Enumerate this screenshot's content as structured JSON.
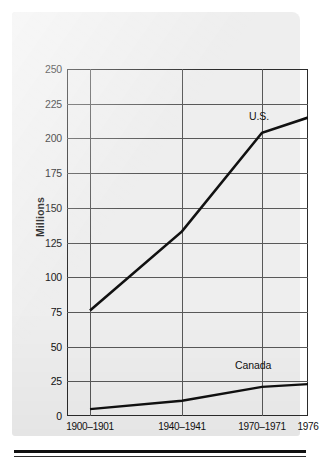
{
  "chart_data": {
    "type": "line",
    "title": "",
    "xlabel": "",
    "ylabel": "Millions",
    "ylim": [
      0,
      250
    ],
    "yticks": [
      0,
      25,
      50,
      75,
      100,
      125,
      150,
      175,
      200,
      225,
      250
    ],
    "ytick_labels": [
      "0",
      "25",
      "50",
      "75",
      "100",
      "125",
      "150",
      "175",
      "200",
      "225",
      "250"
    ],
    "categories": [
      "1900–1901",
      "1940–1941",
      "1970–1971",
      "1976"
    ],
    "grid": true,
    "legend_position": "inline-right",
    "series": [
      {
        "name": "U.S.",
        "values": [
          76,
          133,
          204,
          215
        ],
        "label": "U.S."
      },
      {
        "name": "Canada",
        "values": [
          5,
          11,
          21,
          23
        ],
        "label": "Canada"
      }
    ],
    "annotations": [
      "U.S.",
      "Canada"
    ],
    "colors": {
      "line": "#111111",
      "grid": "#585858",
      "frame": "#2b2b2b",
      "panel": "#eeeeee"
    }
  },
  "axes": {
    "y_title": "Millions",
    "y_ticks": [
      "250",
      "225",
      "200",
      "175",
      "150",
      "125",
      "100",
      "75",
      "50",
      "25",
      "0"
    ],
    "x_ticks": [
      "1900–1901",
      "1940–1941",
      "1970–1971",
      "1976"
    ]
  },
  "labels": {
    "us": "U.S.",
    "canada": "Canada"
  }
}
